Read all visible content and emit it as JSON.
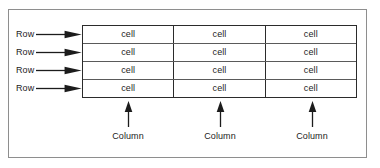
{
  "figure": {
    "name": "table-anatomy-diagram",
    "background_color": "#ffffff",
    "frame_color": "#8e8e8e",
    "line_color": "#2b2b2b",
    "text_color": "#1c1c1c"
  },
  "row_labels": [
    {
      "text": "Row",
      "arrow": "arrow-right"
    },
    {
      "text": "Row",
      "arrow": "arrow-right"
    },
    {
      "text": "Row",
      "arrow": "arrow-right"
    },
    {
      "text": "Row",
      "arrow": "arrow-right"
    }
  ],
  "table": {
    "rows": [
      [
        "cell",
        "cell",
        "cell"
      ],
      [
        "cell",
        "cell",
        "cell"
      ],
      [
        "cell",
        "cell",
        "cell"
      ],
      [
        "cell",
        "cell",
        "cell"
      ]
    ]
  },
  "column_labels": [
    {
      "text": "Column",
      "arrow": "arrow-up"
    },
    {
      "text": "Column",
      "arrow": "arrow-up"
    },
    {
      "text": "Column",
      "arrow": "arrow-up"
    }
  ]
}
